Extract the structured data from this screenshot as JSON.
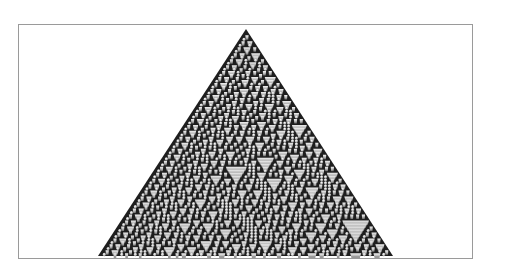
{
  "figure": {
    "frame": {
      "left": 18,
      "top": 24,
      "right": 474,
      "bottom": 260,
      "border_color": "#9a9a9a",
      "background": "#ffffff"
    },
    "automaton": {
      "rule": 30,
      "steps": 76,
      "apex": {
        "x": 246,
        "y": 29
      },
      "base_y": 256,
      "base_left_x": 98,
      "base_right_x": 393,
      "colors": {
        "background_cell": "#1e1e1e",
        "cell_light": "#f4f4f4",
        "cell_mid": "#b8b8b8",
        "cell_dark": "#6a6a6a"
      }
    }
  }
}
